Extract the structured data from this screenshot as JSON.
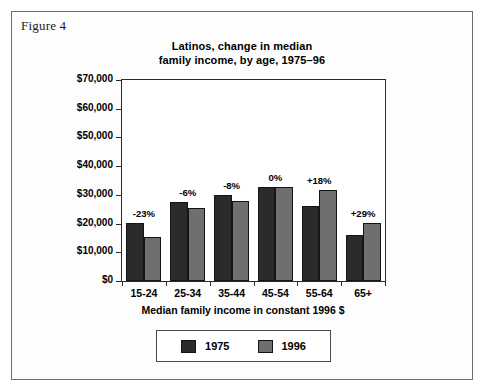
{
  "figure": {
    "caption": "Figure 4"
  },
  "chart_data": {
    "type": "bar",
    "title": "Latinos, change in median family income, by age, 1975–96",
    "title_lines": [
      "Latinos, change in median",
      "family income, by age, 1975–96"
    ],
    "xlabel": "Median family income in constant 1996 $",
    "ylabel": "",
    "categories": [
      "15-24",
      "25-34",
      "35-44",
      "45-54",
      "55-64",
      "65+"
    ],
    "series": [
      {
        "name": "1975",
        "color": "#2b2b2b",
        "values": [
          20200,
          27500,
          29800,
          32900,
          26000,
          16000
        ]
      },
      {
        "name": "1996",
        "color": "#6f6f6f",
        "values": [
          15500,
          25300,
          28000,
          32900,
          31600,
          20300
        ]
      }
    ],
    "annotations": [
      "-23%",
      "-6%",
      "-8%",
      "0%",
      "+18%",
      "+29%"
    ],
    "ylim": [
      0,
      70000
    ],
    "yticks": [
      0,
      10000,
      20000,
      30000,
      40000,
      50000,
      60000,
      70000
    ],
    "ytick_labels": [
      "$0",
      "$10,000",
      "$20,000",
      "$30,000",
      "$40,000",
      "$50,000",
      "$60,000",
      "$70,000"
    ],
    "grid": false,
    "legend_position": "bottom"
  }
}
